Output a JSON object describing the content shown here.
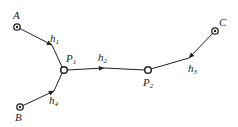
{
  "diagram": {
    "sources": [
      {
        "id": "A",
        "label": "A",
        "x": 17,
        "y": 27,
        "lx": 14,
        "ly": 19
      },
      {
        "id": "B",
        "label": "B",
        "x": 20,
        "y": 107,
        "lx": 15,
        "ly": 121
      },
      {
        "id": "C",
        "label": "C",
        "x": 215,
        "y": 31,
        "lx": 219,
        "ly": 26
      }
    ],
    "junctions": [
      {
        "id": "P1",
        "label": "P",
        "sub": "1",
        "x": 64,
        "y": 70,
        "lx": 66,
        "ly": 62
      },
      {
        "id": "P2",
        "label": "P",
        "sub": "2",
        "x": 148,
        "y": 70,
        "lx": 143,
        "ly": 86
      }
    ],
    "edges": [
      {
        "id": "h1",
        "label": "h",
        "sub": "1",
        "lx": 50,
        "ly": 42
      },
      {
        "id": "h2",
        "label": "h",
        "sub": "2",
        "lx": 98,
        "ly": 61
      },
      {
        "id": "h3",
        "label": "h",
        "sub": "3",
        "lx": 188,
        "ly": 72
      },
      {
        "id": "h4",
        "label": "h",
        "sub": "4",
        "lx": 49,
        "ly": 104
      }
    ]
  }
}
